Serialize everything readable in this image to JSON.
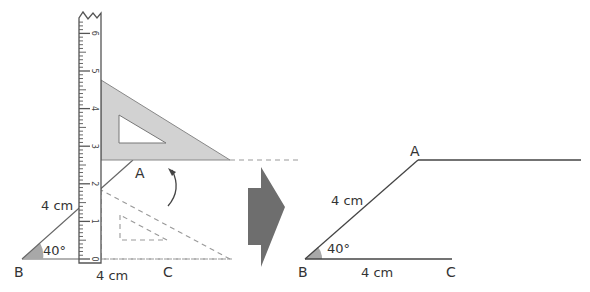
{
  "left_figure": {
    "vertex_A": "A",
    "vertex_B": "B",
    "vertex_C": "C",
    "side_BA_label": "4 cm",
    "side_BC_label": "4 cm",
    "angle_label": "40°",
    "ruler_ticks": [
      "0",
      "1",
      "2",
      "3",
      "4",
      "5",
      "6"
    ]
  },
  "right_figure": {
    "vertex_A": "A",
    "vertex_B": "B",
    "vertex_C": "C",
    "side_BA_label": "4 cm",
    "side_BC_label": "4 cm",
    "angle_label": "40°"
  },
  "colors": {
    "line": "#444444",
    "set_square_fill": "#d2d2d2",
    "arrow_fill": "#6e6e6e",
    "angle_fill": "#a8a8a8",
    "dashed": "#888888"
  }
}
